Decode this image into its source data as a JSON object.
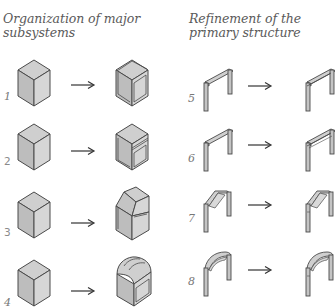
{
  "columns": [
    {
      "title_lines": [
        "Organization of major",
        "subsystems"
      ],
      "rows": [
        {
          "number": "1",
          "before": "box",
          "after": "box-with-panels"
        },
        {
          "number": "2",
          "before": "box",
          "after": "box-with-base-band"
        },
        {
          "number": "3",
          "before": "box",
          "after": "box-with-gable-roof"
        },
        {
          "number": "4",
          "before": "box",
          "after": "box-with-vaulted-roof"
        }
      ]
    },
    {
      "title_lines": [
        "Refinement of the",
        "primary structure"
      ],
      "rows": [
        {
          "number": "5",
          "before": "flat-portal-frame",
          "after": "flat-portal-frame-double-beam"
        },
        {
          "number": "6",
          "before": "flat-portal-frame",
          "after": "flat-portal-frame-double-beam"
        },
        {
          "number": "7",
          "before": "pitched-portal-frame",
          "after": "pitched-portal-frame-refined"
        },
        {
          "number": "8",
          "before": "arched-portal-frame",
          "after": "arched-portal-frame-refined"
        }
      ]
    }
  ],
  "arrow_glyph": "→",
  "colors": {
    "top_face": "#cfcfcf",
    "left_face": "#bdbdbd",
    "right_face": "#d9d9d9",
    "stroke": "#4a4a4a",
    "text": "#5a5a5a"
  }
}
